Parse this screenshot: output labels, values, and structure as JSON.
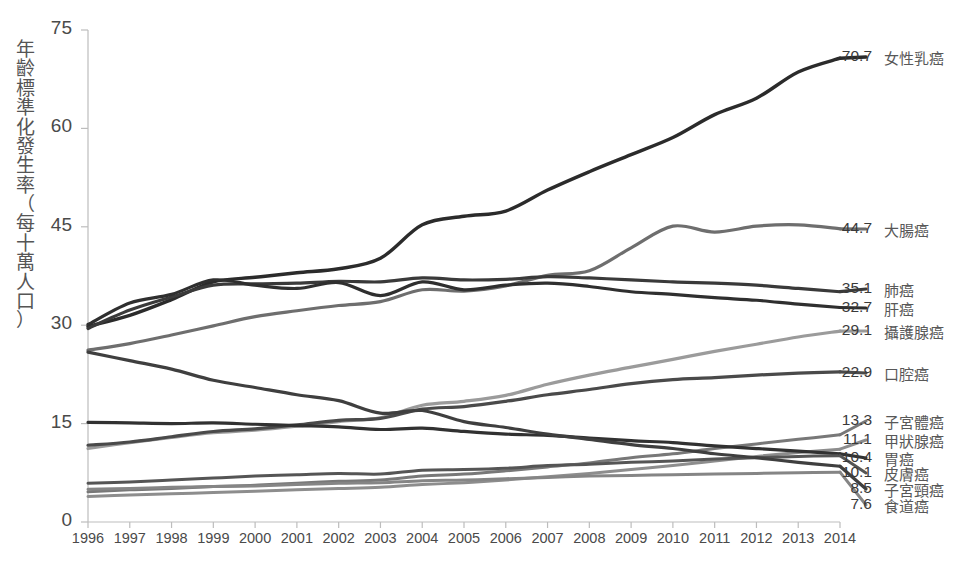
{
  "chart_data": {
    "type": "line",
    "title": "",
    "xlabel": "",
    "ylabel": "年齡標準化發生率（每十萬人口）",
    "ylabel_chars": [
      "年",
      "齡",
      "標",
      "準",
      "化",
      "發",
      "生",
      "率",
      "（",
      "每",
      "十",
      "萬",
      "人",
      "口",
      "）"
    ],
    "xlim": [
      1996,
      2014
    ],
    "ylim": [
      0,
      75
    ],
    "yticks": [
      0,
      15,
      30,
      45,
      60,
      75
    ],
    "ytick_labels": [
      "0",
      "15",
      "30",
      "45",
      "60",
      "75"
    ],
    "grid": false,
    "legend_position": "right-end-labels",
    "x": [
      1996,
      1997,
      1998,
      1999,
      2000,
      2001,
      2002,
      2003,
      2004,
      2005,
      2006,
      2007,
      2008,
      2009,
      2010,
      2011,
      2012,
      2013,
      2014
    ],
    "categories": [
      "1996",
      "1997",
      "1998",
      "1999",
      "2000",
      "2001",
      "2002",
      "2003",
      "2004",
      "2005",
      "2006",
      "2007",
      "2008",
      "2009",
      "2010",
      "2011",
      "2012",
      "2013",
      "2014"
    ],
    "series": [
      {
        "name": "女性乳癌",
        "end_value": "70.7",
        "color": "#2b2b2b",
        "width": 3.4,
        "values": [
          29.8,
          31.5,
          33.9,
          36.6,
          37.3,
          38.0,
          38.6,
          40.2,
          45.3,
          46.6,
          47.4,
          50.6,
          53.4,
          56.0,
          58.6,
          62.1,
          64.6,
          68.6,
          70.7
        ]
      },
      {
        "name": "大腸癌",
        "end_value": "44.7",
        "color": "#6e6e6e",
        "width": 3.2,
        "values": [
          26.2,
          27.2,
          28.5,
          29.9,
          31.3,
          32.2,
          33.0,
          33.6,
          35.4,
          35.2,
          36.0,
          37.6,
          38.3,
          41.8,
          45.1,
          44.2,
          45.1,
          45.3,
          44.7
        ]
      },
      {
        "name": "肺癌",
        "end_value": "35.1",
        "color": "#3a3a3a",
        "width": 3.2,
        "values": [
          29.5,
          32.3,
          34.3,
          36.1,
          36.3,
          36.4,
          36.7,
          36.6,
          37.2,
          36.9,
          37.0,
          37.4,
          37.2,
          36.9,
          36.6,
          36.4,
          36.1,
          35.6,
          35.1
        ]
      },
      {
        "name": "肝癌",
        "end_value": "32.7",
        "color": "#2f2f2f",
        "width": 3.2,
        "values": [
          30.1,
          33.4,
          34.7,
          36.9,
          36.1,
          35.6,
          36.5,
          34.5,
          36.6,
          35.4,
          36.1,
          36.4,
          35.9,
          35.1,
          34.7,
          34.2,
          33.8,
          33.2,
          32.7
        ]
      },
      {
        "name": "攝護腺癌",
        "end_value": "29.1",
        "color": "#9b9b9b",
        "width": 3.2,
        "values": [
          11.2,
          12.1,
          12.9,
          13.6,
          14.0,
          14.6,
          15.3,
          15.9,
          17.8,
          18.4,
          19.3,
          21.0,
          22.4,
          23.6,
          24.8,
          26.0,
          27.1,
          28.2,
          29.1
        ]
      },
      {
        "name": "口腔癌",
        "end_value": "22.9",
        "color": "#4a4a4a",
        "width": 3.2,
        "values": [
          11.7,
          12.2,
          13.0,
          13.8,
          14.2,
          14.8,
          15.5,
          15.8,
          17.2,
          17.6,
          18.4,
          19.4,
          20.2,
          21.1,
          21.7,
          22.0,
          22.4,
          22.7,
          22.9
        ]
      },
      {
        "name": "子宮體癌",
        "end_value": "13.3",
        "color": "#787878",
        "width": 3.0,
        "values": [
          4.6,
          4.9,
          5.1,
          5.4,
          5.6,
          5.9,
          6.2,
          6.4,
          7.0,
          7.3,
          7.8,
          8.4,
          9.0,
          9.8,
          10.4,
          11.2,
          11.9,
          12.6,
          13.3
        ]
      },
      {
        "name": "甲狀腺癌",
        "end_value": "11.1",
        "color": "#8d8d8d",
        "width": 3.0,
        "values": [
          3.9,
          4.1,
          4.3,
          4.5,
          4.7,
          4.9,
          5.1,
          5.3,
          5.7,
          6.0,
          6.4,
          6.9,
          7.4,
          8.0,
          8.6,
          9.3,
          10.0,
          10.6,
          11.1
        ]
      },
      {
        "name": "胃癌",
        "end_value": "10.4",
        "color": "#313131",
        "width": 3.2,
        "values": [
          15.2,
          15.1,
          15.0,
          15.1,
          14.9,
          14.7,
          14.5,
          14.1,
          14.3,
          13.8,
          13.4,
          13.2,
          12.8,
          12.4,
          12.1,
          11.6,
          11.2,
          10.8,
          10.4
        ]
      },
      {
        "name": "皮膚癌",
        "end_value": "10.1",
        "color": "#555555",
        "width": 3.0,
        "values": [
          5.9,
          6.1,
          6.4,
          6.7,
          7.0,
          7.2,
          7.4,
          7.3,
          7.9,
          8.0,
          8.2,
          8.6,
          8.8,
          9.1,
          9.3,
          9.6,
          9.8,
          10.0,
          10.1
        ]
      },
      {
        "name": "子宮頸癌",
        "end_value": "8.5",
        "color": "#3f3f3f",
        "width": 3.2,
        "values": [
          25.9,
          24.6,
          23.3,
          21.6,
          20.5,
          19.4,
          18.5,
          16.6,
          17.0,
          15.3,
          14.4,
          13.4,
          12.6,
          11.8,
          11.2,
          10.4,
          9.8,
          9.1,
          8.5
        ]
      },
      {
        "name": "食道癌",
        "end_value": "7.6",
        "color": "#858585",
        "width": 3.0,
        "values": [
          5.0,
          5.1,
          5.3,
          5.4,
          5.5,
          5.7,
          5.9,
          6.0,
          6.3,
          6.4,
          6.6,
          6.8,
          7.0,
          7.1,
          7.2,
          7.3,
          7.4,
          7.5,
          7.6
        ]
      }
    ]
  },
  "labels": {
    "values": [
      {
        "value": "70.7",
        "name": "女性乳癌",
        "y": 57,
        "color": "#2b2b2b"
      },
      {
        "value": "44.7",
        "name": "大腸癌",
        "y": 229,
        "color": "#6e6e6e"
      },
      {
        "value": "35.1",
        "name": "肺癌",
        "y": 289,
        "color": "#3a3a3a"
      },
      {
        "value": "32.7",
        "name": "肝癌",
        "y": 308,
        "color": "#2f2f2f"
      },
      {
        "value": "29.1",
        "name": "攝護腺癌",
        "y": 331,
        "color": "#9b9b9b"
      },
      {
        "value": "22.9",
        "name": "口腔癌",
        "y": 373,
        "color": "#4a4a4a"
      },
      {
        "value": "13.3",
        "name": "子宮體癌",
        "y": 421,
        "color": "#787878"
      },
      {
        "value": "11.1",
        "name": "甲狀腺癌",
        "y": 440,
        "color": "#8d8d8d"
      },
      {
        "value": "10.4",
        "name": "胃癌",
        "y": 458,
        "color": "#313131"
      },
      {
        "value": "10.1",
        "name": "皮膚癌",
        "y": 473,
        "color": "#555555"
      },
      {
        "value": "8.5",
        "name": "子宮頸癌",
        "y": 489,
        "color": "#3f3f3f"
      },
      {
        "value": "7.6",
        "name": "食道癌",
        "y": 505,
        "color": "#858585"
      }
    ]
  }
}
